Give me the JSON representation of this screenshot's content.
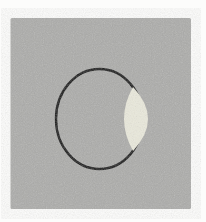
{
  "figure": {
    "alt": "Scanned grayscale figure: a gray square containing a black circle outline with a pale lens-shaped (vesica) region overlapping the circle's right edge",
    "colors": {
      "page_background": "#fcfcfb",
      "square_fill": "#a7a7a5",
      "circle_stroke": "#161616",
      "lens_fill": "#e9e8da"
    },
    "geometry": {
      "canvas": {
        "width": 206,
        "height": 222
      },
      "square": {
        "x": 10.5,
        "y": 18,
        "width": 180.5,
        "height": 191,
        "corner_radius": 1.5
      },
      "circle": {
        "cx": 99.5,
        "cy": 119,
        "rx": 43.5,
        "ry": 50,
        "stroke_width": 2.4
      },
      "lens": {
        "path": "M 133 87.1 Q 115 119 133 150.9 Q 163 119 133 87.1 Z"
      }
    },
    "grain_opacity": 0.9
  }
}
